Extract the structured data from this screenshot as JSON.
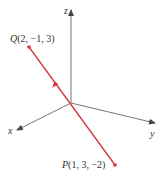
{
  "figure": {
    "axes": {
      "x_label": "x",
      "y_label": "y",
      "z_label": "z",
      "axis_color": "#555555"
    },
    "line_color": "#d9343b",
    "points": {
      "Q": {
        "name": "Q",
        "coords": "(2, −1, 3)"
      },
      "P": {
        "name": "P",
        "coords": "(1, 3, −2)"
      }
    }
  }
}
